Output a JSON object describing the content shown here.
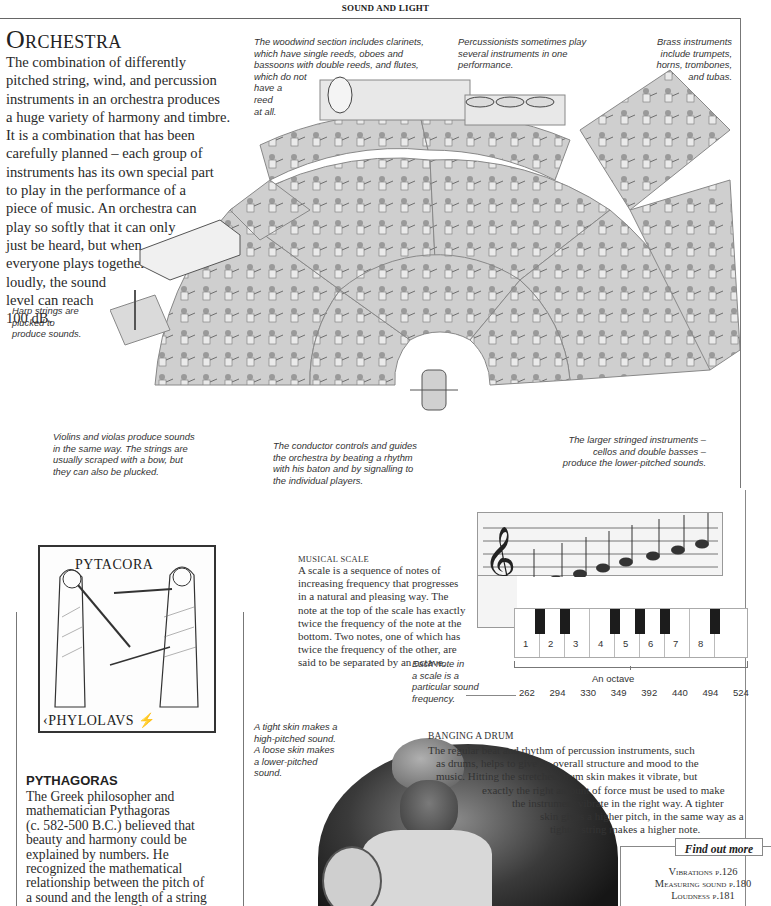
{
  "running_head": "SOUND AND LIGHT",
  "orchestra": {
    "title": "Orchestra",
    "intro_lines": [
      "The combination of differently",
      "pitched string, wind, and percussion",
      "instruments in an orchestra produces",
      "a huge variety of harmony and timbre.",
      "It is a combination that has been",
      "carefully planned – each group of",
      "instruments has its own special part",
      "to play in the performance of a",
      "piece of music. An orchestra can",
      "play so softly that it can only",
      "just be heard, but when",
      "everyone plays together",
      "loudly, the sound",
      "level can reach",
      "100 dB."
    ],
    "captions": {
      "woodwind": [
        "The woodwind section includes clarinets,",
        "which have single reeds, oboes and",
        "bassoons with double reeds, and flutes,",
        "which do not",
        "have a",
        "reed",
        "at all."
      ],
      "percussion": [
        "Percussionists sometimes play",
        "several instruments in one",
        "performance."
      ],
      "brass": [
        "Brass instruments",
        "include trumpets,",
        "horns, trombones,",
        "and tubas."
      ],
      "harp": [
        "Harp strings are",
        "plucked to",
        "produce sounds."
      ],
      "violins": [
        "Violins and violas produce sounds",
        "in the same way. The strings are",
        "usually scraped with a bow, but",
        "they can also be plucked."
      ],
      "conductor": [
        "The conductor controls and guides",
        "the orchestra by beating a rhythm",
        "with his baton and by signalling to",
        "the individual players."
      ],
      "cellos": [
        "The larger stringed instruments –",
        "cellos and double basses –",
        "produce the lower-pitched sounds."
      ]
    }
  },
  "pythagoras": {
    "woodcut_top_label": "PYTACORA",
    "woodcut_bottom_label": "‹PHYLOLAVS ⚡",
    "heading": "PYTHAGORAS",
    "body_lines": [
      "The Greek philosopher and",
      "mathematician Pythagoras",
      "(c. 582-500 B.C.) believed that",
      "beauty and harmony could be",
      "explained by numbers. He",
      "recognized the mathematical",
      "relationship between the pitch of",
      "a sound and the length of a string",
      "or pipe, or the size of a bell. He"
    ]
  },
  "musical_scale": {
    "heading": "Musical scale",
    "body_lines": [
      "A scale is a sequence of notes of",
      "increasing frequency that progresses",
      "in a natural and pleasing way. The",
      "note at the top of the scale has exactly",
      "twice the frequency of the note at the",
      "bottom. Two notes, one of which has",
      "twice the frequency of the other, are",
      "said to be separated by an octave."
    ],
    "keys": [
      "1",
      "2",
      "3",
      "4",
      "5",
      "6",
      "7",
      "8"
    ],
    "octave_label": "An octave",
    "frequencies": [
      "262",
      "294",
      "330",
      "349",
      "392",
      "440",
      "494",
      "524"
    ],
    "note_caption": [
      "Each note in",
      "a scale is a",
      "particular sound",
      "frequency."
    ]
  },
  "drum": {
    "caption": [
      "A tight skin makes a",
      "high-pitched sound.",
      "A loose skin makes",
      "a lower-pitched",
      "sound."
    ],
    "heading": "Banging a drum",
    "body_lines": [
      "The regular beat and rhythm of percussion instruments, such",
      "as drums, helps to give an overall structure and mood to the",
      "music. Hitting the stretched drum skin makes it vibrate, but",
      "exactly the right amount of force must be used to make",
      "the instrument vibrate in the right way. A tighter",
      "skin gives a higher pitch, in the same way as a",
      "tighter string makes a higher note."
    ],
    "body_indents": [
      0,
      8,
      8,
      54,
      84,
      112,
      122
    ]
  },
  "find_out_more": {
    "title": "Find out more",
    "links": [
      "Vibrations p.126",
      "Measuring sound p.180",
      "Loudness p.181"
    ]
  }
}
